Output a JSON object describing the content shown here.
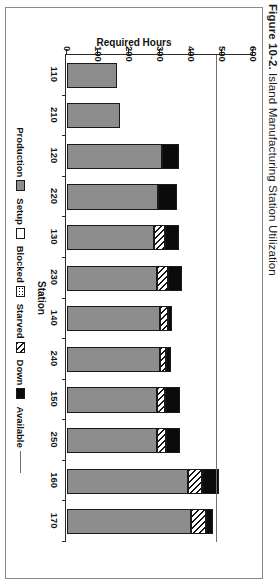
{
  "figure": {
    "number": "Figure 10-2.",
    "caption": "Island Manufacturing Station Utilization"
  },
  "axes": {
    "value_axis_title": "Required Hours",
    "category_axis_title": "Station",
    "value_ticks": [
      "600",
      "500",
      "400",
      "300",
      "200",
      "100",
      "0"
    ]
  },
  "legend": {
    "items": [
      {
        "label": "Production",
        "swatch": "gray-fill"
      },
      {
        "label": "Setup",
        "swatch": "white-fill"
      },
      {
        "label": "Blocked",
        "swatch": "dotted-fill"
      },
      {
        "label": "Starved",
        "swatch": "hatch-fill"
      },
      {
        "label": "Down",
        "swatch": "black-fill"
      },
      {
        "label": "Available",
        "swatch": "reference-line"
      }
    ]
  },
  "chart_data": {
    "type": "bar",
    "title": "Island Manufacturing Station Utilization",
    "xlabel": "Station",
    "ylabel": "Required Hours",
    "ylim": [
      0,
      600
    ],
    "yticks": [
      0,
      100,
      200,
      300,
      400,
      500,
      600
    ],
    "grid": false,
    "legend_position": "bottom",
    "orientation": "vertical-stacked",
    "categories": [
      "110",
      "210",
      "120",
      "220",
      "130",
      "230",
      "140",
      "240",
      "150",
      "250",
      "160",
      "170"
    ],
    "series": [
      {
        "name": "Production",
        "values": [
          160,
          170,
          305,
          295,
          280,
          290,
          300,
          300,
          290,
          290,
          390,
          400
        ]
      },
      {
        "name": "Setup",
        "values": [
          0,
          0,
          0,
          0,
          0,
          0,
          0,
          0,
          0,
          0,
          0,
          0
        ]
      },
      {
        "name": "Blocked",
        "values": [
          0,
          0,
          0,
          0,
          0,
          0,
          0,
          0,
          0,
          0,
          0,
          0
        ]
      },
      {
        "name": "Starved",
        "values": [
          0,
          0,
          0,
          0,
          35,
          35,
          25,
          20,
          25,
          30,
          45,
          50
        ]
      },
      {
        "name": "Down",
        "values": [
          0,
          0,
          55,
          60,
          45,
          45,
          15,
          15,
          50,
          45,
          55,
          20
        ]
      }
    ],
    "reference_line": {
      "name": "Available",
      "value": 480
    }
  }
}
